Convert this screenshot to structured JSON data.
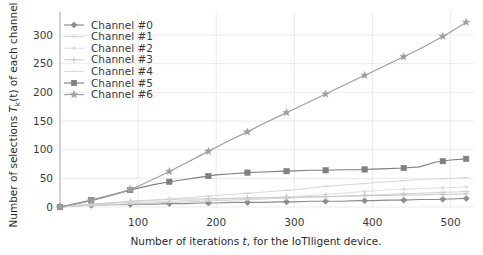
{
  "chart_data": {
    "type": "line",
    "title": "",
    "xlabel": "Number of iterations t, for the IoTIligent device.",
    "xlabel_parts": {
      "pre": "Number of iterations ",
      "ital": "t",
      "post": ", for the IoTIligent device."
    },
    "ylabel": "Number of selections Tₖ(t) of each channel",
    "ylabel_parts": {
      "pre": "Number of selections ",
      "ital": "T",
      "sub": "k",
      "mid": "(t)",
      "post": " of each channel"
    },
    "xlim": [
      0,
      530
    ],
    "ylim": [
      0,
      340
    ],
    "xticks": [
      100,
      200,
      300,
      400,
      500
    ],
    "yticks": [
      0,
      50,
      100,
      150,
      200,
      250,
      300
    ],
    "grid": true,
    "legend_position": "upper left",
    "x": [
      0,
      20,
      40,
      60,
      80,
      100,
      120,
      140,
      160,
      180,
      200,
      220,
      240,
      260,
      280,
      300,
      320,
      340,
      360,
      380,
      400,
      420,
      440,
      460,
      480,
      500,
      520
    ],
    "series": [
      {
        "name": "Channel #0",
        "label": "Channel #0",
        "marker": "diamond",
        "color": "#8c8c8c",
        "values": [
          0,
          2,
          3,
          4,
          4,
          5,
          5,
          6,
          6,
          7,
          7,
          8,
          8,
          8,
          9,
          9,
          10,
          10,
          10,
          11,
          11,
          12,
          12,
          13,
          13,
          14,
          15
        ]
      },
      {
        "name": "Channel #1",
        "label": "Channel #1",
        "marker": "dash",
        "color": "#cfcfcf",
        "values": [
          0,
          2,
          3,
          4,
          5,
          6,
          7,
          8,
          9,
          10,
          11,
          12,
          13,
          14,
          15,
          16,
          17,
          18,
          19,
          20,
          21,
          22,
          23,
          24,
          25,
          26,
          27
        ]
      },
      {
        "name": "Channel #2",
        "label": "Channel #2",
        "marker": "dot",
        "color": "#dcdcdc",
        "values": [
          0,
          2,
          4,
          6,
          7,
          8,
          9,
          10,
          11,
          12,
          13,
          14,
          15,
          16,
          17,
          18,
          20,
          22,
          24,
          26,
          28,
          30,
          31,
          32,
          33,
          34,
          35
        ]
      },
      {
        "name": "Channel #3",
        "label": "Channel #3",
        "marker": "plus",
        "color": "#c6c6c6",
        "values": [
          0,
          3,
          5,
          7,
          9,
          11,
          12,
          13,
          14,
          14,
          15,
          15,
          16,
          16,
          17,
          17,
          18,
          18,
          19,
          19,
          20,
          20,
          21,
          21,
          22,
          22,
          23
        ]
      },
      {
        "name": "Channel #4",
        "label": "Channel #4",
        "marker": "dash",
        "color": "#d6d6d6",
        "values": [
          0,
          2,
          4,
          6,
          8,
          10,
          12,
          14,
          16,
          18,
          20,
          22,
          24,
          26,
          28,
          30,
          33,
          36,
          38,
          40,
          42,
          44,
          46,
          48,
          49,
          50,
          51
        ]
      },
      {
        "name": "Channel #5",
        "label": "Channel #5",
        "marker": "square",
        "color": "#808080",
        "values": [
          0,
          6,
          12,
          19,
          26,
          33,
          39,
          44,
          48,
          52,
          56,
          58,
          60,
          61,
          62,
          63,
          64,
          64,
          65,
          65,
          66,
          67,
          68,
          70,
          78,
          82,
          84
        ]
      },
      {
        "name": "Channel #6",
        "label": "Channel #6",
        "marker": "star",
        "color": "#9e9e9e",
        "values": [
          0,
          5,
          11,
          18,
          26,
          36,
          49,
          62,
          76,
          90,
          104,
          118,
          131,
          145,
          158,
          171,
          184,
          197,
          210,
          223,
          236,
          249,
          262,
          275,
          290,
          305,
          322
        ]
      }
    ],
    "marker_x": [
      0,
      40,
      90,
      140,
      190,
      240,
      290,
      340,
      390,
      440,
      490,
      520
    ]
  },
  "colors": {
    "background": "#ffffff",
    "grid": "#e3e3e8",
    "axis": "#9a9a9a",
    "text": "#3a3a3a"
  }
}
